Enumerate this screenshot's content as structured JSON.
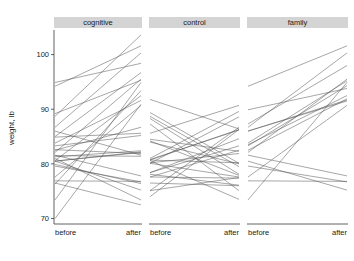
{
  "chart_data": {
    "type": "line",
    "title": "",
    "subtitle": "",
    "xlabel": "",
    "ylabel": "weight, lb",
    "x": [
      "before",
      "after"
    ],
    "xlim": [
      0,
      1
    ],
    "ylim": [
      69.0,
      104.5
    ],
    "yticks": [
      70,
      80,
      90,
      100
    ],
    "ytick_labels": [
      "70",
      "80",
      "90",
      "100"
    ],
    "xtick_labels": [
      "before",
      "after"
    ],
    "grid": false,
    "legend": "none",
    "layout": "facet-row",
    "facet_strip_color": "#d4d4d4",
    "line_color": "#555555",
    "panels": [
      {
        "label": "cognitive",
        "series": [
          {
            "name": "s1",
            "values": [
              80.5,
              82.2
            ]
          },
          {
            "name": "s2",
            "values": [
              84.9,
              85.6
            ]
          },
          {
            "name": "s3",
            "values": [
              81.5,
              81.4
            ]
          },
          {
            "name": "s4",
            "values": [
              82.6,
              81.9
            ]
          },
          {
            "name": "s5",
            "values": [
              79.9,
              76.4
            ]
          },
          {
            "name": "s6",
            "values": [
              88.7,
              103.6
            ]
          },
          {
            "name": "s7",
            "values": [
              94.9,
              98.4
            ]
          },
          {
            "name": "s8",
            "values": [
              76.3,
              93.4
            ]
          },
          {
            "name": "s9",
            "values": [
              81.0,
              73.4
            ]
          },
          {
            "name": "s10",
            "values": [
              80.5,
              82.1
            ]
          },
          {
            "name": "s11",
            "values": [
              85.0,
              96.7
            ]
          },
          {
            "name": "s12",
            "values": [
              89.2,
              95.3
            ]
          },
          {
            "name": "s13",
            "values": [
              81.3,
              82.4
            ]
          },
          {
            "name": "s14",
            "values": [
              76.5,
              72.5
            ]
          },
          {
            "name": "s15",
            "values": [
              70.0,
              90.9
            ]
          },
          {
            "name": "s16",
            "values": [
              80.6,
              92.5
            ]
          },
          {
            "name": "s17",
            "values": [
              83.8,
              91.6
            ]
          },
          {
            "name": "s18",
            "values": [
              83.3,
              85.2
            ]
          },
          {
            "name": "s19",
            "values": [
              86.0,
              81.6
            ]
          },
          {
            "name": "s20",
            "values": [
              82.5,
              86.7
            ]
          },
          {
            "name": "s21",
            "values": [
              86.7,
              100.3
            ]
          },
          {
            "name": "s22",
            "values": [
              79.6,
              76.7
            ]
          },
          {
            "name": "s23",
            "values": [
              76.9,
              76.8
            ]
          },
          {
            "name": "s24",
            "values": [
              94.2,
              101.6
            ]
          },
          {
            "name": "s25",
            "values": [
              73.4,
              94.9
            ]
          },
          {
            "name": "s26",
            "values": [
              80.5,
              75.2
            ]
          },
          {
            "name": "s27",
            "values": [
              81.6,
              77.8
            ]
          },
          {
            "name": "s28",
            "values": [
              82.1,
              95.5
            ]
          },
          {
            "name": "s29",
            "values": [
              77.6,
              90.7
            ]
          }
        ]
      },
      {
        "label": "control",
        "series": [
          {
            "name": "c1",
            "values": [
              80.7,
              80.2
            ]
          },
          {
            "name": "c2",
            "values": [
              89.4,
              80.1
            ]
          },
          {
            "name": "c3",
            "values": [
              91.8,
              86.4
            ]
          },
          {
            "name": "c4",
            "values": [
              74.0,
              86.3
            ]
          },
          {
            "name": "c5",
            "values": [
              78.1,
              76.1
            ]
          },
          {
            "name": "c6",
            "values": [
              88.3,
              78.1
            ]
          },
          {
            "name": "c7",
            "values": [
              87.3,
              75.1
            ]
          },
          {
            "name": "c8",
            "values": [
              75.1,
              86.7
            ]
          },
          {
            "name": "c9",
            "values": [
              80.6,
              73.5
            ]
          },
          {
            "name": "c10",
            "values": [
              78.4,
              84.6
            ]
          },
          {
            "name": "c11",
            "values": [
              77.6,
              77.4
            ]
          },
          {
            "name": "c12",
            "values": [
              88.7,
              79.5
            ]
          },
          {
            "name": "c13",
            "values": [
              81.0,
              89.6
            ]
          },
          {
            "name": "c14",
            "values": [
              80.2,
              81.9
            ]
          },
          {
            "name": "c15",
            "values": [
              76.5,
              76.0
            ]
          },
          {
            "name": "c16",
            "values": [
              80.1,
              77.6
            ]
          },
          {
            "name": "c17",
            "values": [
              80.7,
              86.3
            ]
          },
          {
            "name": "c18",
            "values": [
              84.0,
              80.0
            ]
          },
          {
            "name": "c19",
            "values": [
              84.5,
              82.3
            ]
          },
          {
            "name": "c20",
            "values": [
              80.8,
              86.2
            ]
          },
          {
            "name": "c21",
            "values": [
              78.4,
              83.3
            ]
          },
          {
            "name": "c22",
            "values": [
              77.6,
              82.5
            ]
          },
          {
            "name": "c23",
            "values": [
              80.1,
              88.6
            ]
          },
          {
            "name": "c24",
            "values": [
              75.1,
              77.5
            ]
          },
          {
            "name": "c25",
            "values": [
              84.2,
              77.9
            ]
          },
          {
            "name": "c26",
            "values": [
              85.6,
              90.7
            ]
          }
        ]
      },
      {
        "label": "family",
        "series": [
          {
            "name": "f1",
            "values": [
              83.8,
              95.2
            ]
          },
          {
            "name": "f2",
            "values": [
              83.3,
              94.3
            ]
          },
          {
            "name": "f3",
            "values": [
              86.0,
              91.5
            ]
          },
          {
            "name": "f4",
            "values": [
              82.5,
              91.9
            ]
          },
          {
            "name": "f5",
            "values": [
              86.7,
              100.3
            ]
          },
          {
            "name": "f6",
            "values": [
              79.6,
              76.7
            ]
          },
          {
            "name": "f7",
            "values": [
              76.9,
              76.8
            ]
          },
          {
            "name": "f8",
            "values": [
              94.2,
              101.6
            ]
          },
          {
            "name": "f9",
            "values": [
              73.4,
              94.9
            ]
          },
          {
            "name": "f10",
            "values": [
              80.5,
              75.2
            ]
          },
          {
            "name": "f11",
            "values": [
              81.6,
              77.8
            ]
          },
          {
            "name": "f12",
            "values": [
              82.1,
              95.5
            ]
          },
          {
            "name": "f13",
            "values": [
              77.6,
              90.7
            ]
          },
          {
            "name": "f14",
            "values": [
              83.5,
              92.5
            ]
          },
          {
            "name": "f15",
            "values": [
              89.9,
              93.8
            ]
          },
          {
            "name": "f16",
            "values": [
              86.0,
              91.7
            ]
          },
          {
            "name": "f17",
            "values": [
              87.3,
              98.0
            ]
          }
        ]
      }
    ]
  },
  "axis": {
    "y_title": "weight, lb"
  }
}
